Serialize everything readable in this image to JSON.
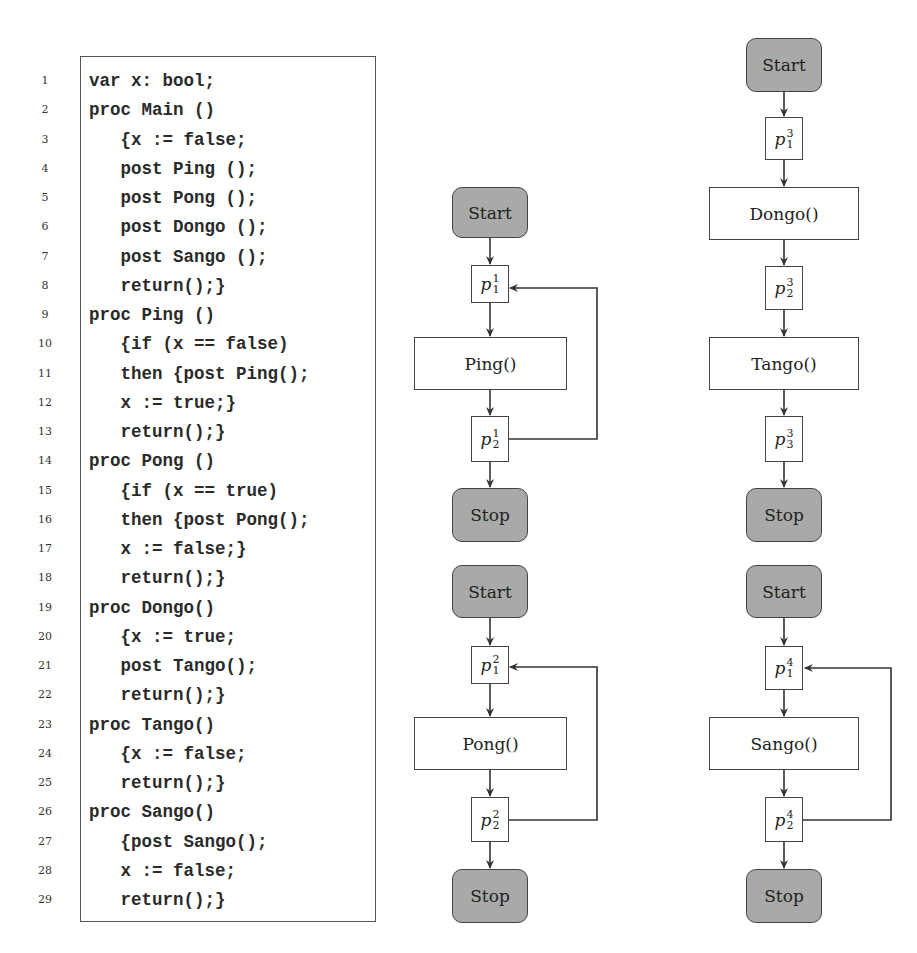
{
  "code_listing": {
    "lines": [
      {
        "num": "1",
        "text": "var x: bool;"
      },
      {
        "num": "2",
        "text": "proc Main ()"
      },
      {
        "num": "3",
        "text": "   {x := false;"
      },
      {
        "num": "4",
        "text": "   post Ping ();"
      },
      {
        "num": "5",
        "text": "   post Pong ();"
      },
      {
        "num": "6",
        "text": "   post Dongo ();"
      },
      {
        "num": "7",
        "text": "   post Sango ();"
      },
      {
        "num": "8",
        "text": "   return();}"
      },
      {
        "num": "9",
        "text": "proc Ping ()"
      },
      {
        "num": "10",
        "text": "   {if (x == false)"
      },
      {
        "num": "11",
        "text": "   then {post Ping();"
      },
      {
        "num": "12",
        "text": "   x := true;}"
      },
      {
        "num": "13",
        "text": "   return();}"
      },
      {
        "num": "14",
        "text": "proc Pong ()"
      },
      {
        "num": "15",
        "text": "   {if (x == true)"
      },
      {
        "num": "16",
        "text": "   then {post Pong();"
      },
      {
        "num": "17",
        "text": "   x := false;}"
      },
      {
        "num": "18",
        "text": "   return();}"
      },
      {
        "num": "19",
        "text": "proc Dongo()"
      },
      {
        "num": "20",
        "text": "   {x := true;"
      },
      {
        "num": "21",
        "text": "   post Tango();"
      },
      {
        "num": "22",
        "text": "   return();}"
      },
      {
        "num": "23",
        "text": "proc Tango()"
      },
      {
        "num": "24",
        "text": "   {x := false;"
      },
      {
        "num": "25",
        "text": "   return();}"
      },
      {
        "num": "26",
        "text": "proc Sango()"
      },
      {
        "num": "27",
        "text": "   {post Sango();"
      },
      {
        "num": "28",
        "text": "   x := false;"
      },
      {
        "num": "29",
        "text": "   return();}"
      }
    ]
  },
  "flowcharts": {
    "ping": {
      "start": "Start",
      "p1": "p",
      "p1_sup": "1",
      "p1_sub": "1",
      "proc": "Ping()",
      "p2": "p",
      "p2_sup": "1",
      "p2_sub": "2",
      "stop": "Stop"
    },
    "pong": {
      "start": "Start",
      "p1": "p",
      "p1_sup": "2",
      "p1_sub": "1",
      "proc": "Pong()",
      "p2": "p",
      "p2_sup": "2",
      "p2_sub": "2",
      "stop": "Stop"
    },
    "dongo": {
      "start": "Start",
      "p1": "p",
      "p1_sup": "3",
      "p1_sub": "1",
      "proc1": "Dongo()",
      "p2": "p",
      "p2_sup": "3",
      "p2_sub": "2",
      "proc2": "Tango()",
      "p3": "p",
      "p3_sup": "3",
      "p3_sub": "3",
      "stop": "Stop"
    },
    "sango": {
      "start": "Start",
      "p1": "p",
      "p1_sup": "4",
      "p1_sub": "1",
      "proc": "Sango()",
      "p2": "p",
      "p2_sup": "4",
      "p2_sub": "2",
      "stop": "Stop"
    }
  },
  "colors": {
    "terminal_fill": "#a9a9a9",
    "stroke": "#444444"
  }
}
